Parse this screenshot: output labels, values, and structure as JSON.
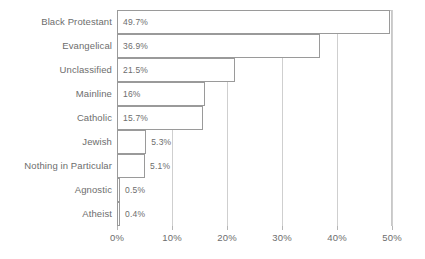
{
  "chart_data": {
    "type": "bar",
    "orientation": "horizontal",
    "title": "",
    "subtitle": "",
    "xlabel": "",
    "ylabel": "",
    "xlim": [
      0,
      50
    ],
    "grid": true,
    "legend": false,
    "legend_position": "none",
    "categories": [
      "Black Protestant",
      "Evangelical",
      "Unclassified",
      "Mainline",
      "Catholic",
      "Jewish",
      "Nothing in Particular",
      "Agnostic",
      "Atheist"
    ],
    "values": [
      49.7,
      36.9,
      21.5,
      16,
      15.7,
      5.3,
      5.1,
      0.5,
      0.4
    ],
    "value_labels": [
      "49.7%",
      "36.9%",
      "21.5%",
      "16%",
      "15.7%",
      "5.3%",
      "5.1%",
      "0.5%",
      "0.4%"
    ],
    "xticks": [
      0,
      10,
      20,
      30,
      40,
      50
    ],
    "xtick_labels": [
      "0%",
      "10%",
      "20%",
      "30%",
      "40%",
      "50%"
    ]
  },
  "style": {
    "bar_fill": "#ffffff",
    "bar_border": "#9a9a9a",
    "grid_color": "#cfcfcf",
    "axis_color": "#b5b5b5",
    "text_color": "#6d6d6d",
    "background": "#ffffff"
  }
}
